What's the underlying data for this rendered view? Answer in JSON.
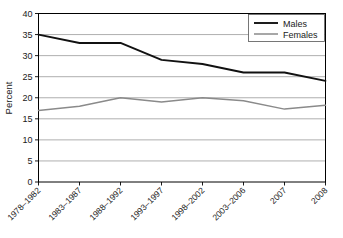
{
  "chart_data": {
    "type": "line",
    "title": "",
    "xlabel": "",
    "ylabel": "Percent",
    "ylim": [
      0,
      40
    ],
    "ytick_step": 5,
    "yticks": [
      "0",
      "5",
      "10",
      "15",
      "20",
      "25",
      "30",
      "35",
      "40"
    ],
    "grid": true,
    "legend_position": "top-right",
    "categories": [
      "1978–1982",
      "1983–1987",
      "1988–1992",
      "1993–1997",
      "1998–2002",
      "2003–2006",
      "2007",
      "2008"
    ],
    "series": [
      {
        "name": "Males",
        "color": "#111111",
        "values": [
          35,
          33,
          33,
          29,
          28,
          26,
          26,
          24
        ]
      },
      {
        "name": "Females",
        "color": "#8a8a8a",
        "values": [
          17,
          18,
          20,
          19,
          20,
          19.3,
          17.3,
          18.2
        ]
      }
    ]
  },
  "legend": {
    "entries": [
      {
        "label": "Males"
      },
      {
        "label": "Females"
      }
    ]
  },
  "axes": {
    "y_title": "Percent"
  },
  "colors": {
    "males": "#111111",
    "females": "#8a8a8a",
    "grid": "#8c8c8c",
    "axis": "#000000",
    "background": "#ffffff"
  }
}
